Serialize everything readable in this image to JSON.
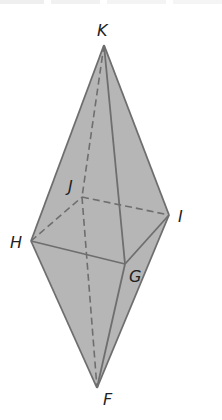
{
  "diagram": {
    "type": "bipyramid",
    "colors": {
      "fill": "#b6b6b6",
      "edge": "#6e6e6e",
      "label": "#222222",
      "background": "#ffffff"
    },
    "vertices": {
      "K": {
        "label": "K",
        "x": 104,
        "y": 45
      },
      "J": {
        "label": "J",
        "x": 82,
        "y": 197
      },
      "I": {
        "label": "I",
        "x": 169,
        "y": 215
      },
      "H": {
        "label": "H",
        "x": 31,
        "y": 241
      },
      "G": {
        "label": "G",
        "x": 125,
        "y": 264
      },
      "F": {
        "label": "F",
        "x": 97,
        "y": 388
      }
    },
    "labels": {
      "K": "K",
      "J": "J",
      "I": "I",
      "H": "H",
      "G": "G",
      "F": "F"
    },
    "visible_edges": [
      "K-H",
      "K-G",
      "K-I",
      "H-G",
      "G-I",
      "H-F",
      "G-F",
      "I-F"
    ],
    "hidden_edges": [
      "K-J",
      "H-J",
      "J-I",
      "J-F"
    ]
  }
}
